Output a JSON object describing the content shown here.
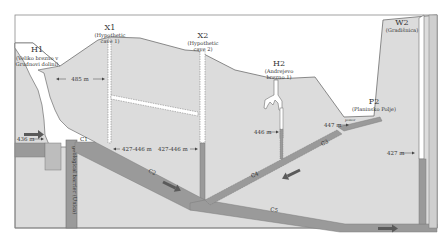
{
  "colors": {
    "background": "#ffffff",
    "rock": "#dcdcdc",
    "rock_edge": "#6f6f6f",
    "conduit": "#9a9a9a",
    "conduit_edge": "#7c7c7c",
    "water": "#a5a5a5",
    "arrow": "#5a5a5a",
    "text": "#333333",
    "cave_void": "#ffffff"
  },
  "sites": {
    "H1": {
      "id": "H1",
      "name": "(Veliko brezno v",
      "name2": "Grudnovi dolini)"
    },
    "X1": {
      "id": "X1",
      "name": "(Hypothetic",
      "name2": "cave 1)"
    },
    "X2": {
      "id": "X2",
      "name": "(Hypothetic",
      "name2": "cave 2)"
    },
    "H2": {
      "id": "H2",
      "name": "(Andrejevo",
      "name2": "brezno 1)"
    },
    "P2": {
      "id": "P2",
      "name": "(Planinsko Polje)"
    },
    "W2": {
      "id": "W2",
      "name": "(Gradišnica)"
    }
  },
  "measurements": {
    "h1_x1_distance": "485 m",
    "h1_water_level": "436 m",
    "x1_level": "427-446 m",
    "x2_level": "427-446 m",
    "h2_level": "446 m",
    "p2_level": "447 m",
    "w2_level": "427 m"
  },
  "conduits": {
    "c1": "C1",
    "c2": "C2",
    "c3": "C3",
    "c4": "C4",
    "c5": "C5"
  },
  "barrier_label": "geological barrier (Unica)",
  "ponor_label": "ponor"
}
